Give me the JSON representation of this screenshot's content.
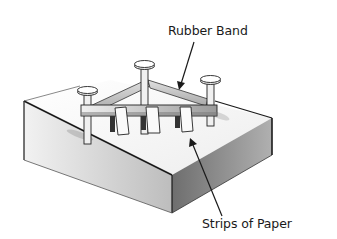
{
  "diagram": {
    "labels": {
      "rubber_band": "Rubber Band",
      "strips_of_paper": "Strips of Paper"
    },
    "components": [
      "wooden block",
      "three nails",
      "rubber band",
      "three paper strips",
      "horizontal bar"
    ],
    "colors": {
      "outline": "#1a1a1a",
      "block_top": "#f4f4f4",
      "block_left": "#d9d9d9",
      "block_right": "#8c8c8c",
      "background": "#ffffff"
    }
  }
}
